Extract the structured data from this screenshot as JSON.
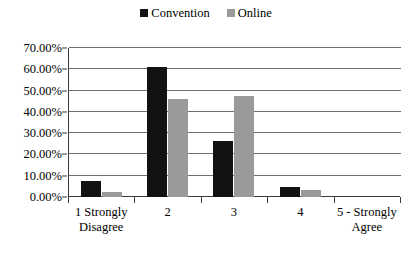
{
  "chart_data": {
    "type": "bar",
    "title": "",
    "subtitle": "",
    "xlabel": "",
    "ylabel": "",
    "categories": [
      "1 Strongly Disagree",
      "2",
      "3",
      "4",
      "5 - Strongly Agree"
    ],
    "series": [
      {
        "name": "Convention",
        "color": "#121212",
        "values": [
          7.5,
          61.0,
          26.5,
          4.5,
          0.0
        ]
      },
      {
        "name": "Online",
        "color": "#9a9a9a",
        "values": [
          2.5,
          46.0,
          47.5,
          3.5,
          0.0
        ]
      }
    ],
    "ylim": [
      0,
      70
    ],
    "y_ticks": [
      0,
      10,
      20,
      30,
      40,
      50,
      60,
      70
    ],
    "y_tick_labels": [
      "0.00%",
      "10.00%",
      "20.00%",
      "30.00%",
      "40.00%",
      "50.00%",
      "60.00%",
      "70.00%"
    ],
    "value_unit": "%",
    "grid": "horizontal",
    "legend_position": "top-center"
  },
  "legend": {
    "items": [
      {
        "label": "Convention",
        "color": "#121212"
      },
      {
        "label": "Online",
        "color": "#9a9a9a"
      }
    ]
  },
  "axes": {
    "y_tick_labels": [
      "70.00%",
      "60.00%",
      "50.00%",
      "40.00%",
      "30.00%",
      "20.00%",
      "10.00%",
      "0.00%"
    ],
    "x_tick_labels": [
      "1 Strongly Disagree",
      "2",
      "3",
      "4",
      "5 - Strongly Agree"
    ]
  },
  "colors": {
    "convention": "#121212",
    "online": "#9a9a9a",
    "gridline": "#6f6f6f",
    "axis": "#3b3b3b",
    "background": "#ffffff"
  }
}
